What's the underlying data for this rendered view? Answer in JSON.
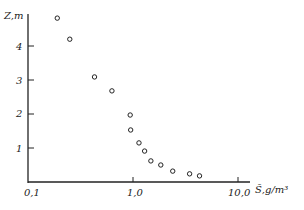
{
  "chart_data": {
    "type": "scatter",
    "title": "",
    "xlabel": "S̄, g/m³",
    "ylabel": "Z, m",
    "xscale": "log",
    "xlim": [
      0.1,
      12
    ],
    "ylim": [
      0,
      5
    ],
    "xticks": [
      "0,1",
      "1,0",
      "10,0"
    ],
    "yticks": [
      "1",
      "2",
      "3",
      "4"
    ],
    "grid": false,
    "legend": null,
    "x": [
      0.19,
      0.25,
      0.43,
      0.63,
      0.94,
      0.95,
      1.14,
      1.29,
      1.48,
      1.84,
      2.39,
      3.46,
      4.3
    ],
    "y": [
      4.82,
      4.2,
      3.09,
      2.68,
      1.97,
      1.53,
      1.15,
      0.91,
      0.62,
      0.5,
      0.32,
      0.24,
      0.18
    ]
  },
  "axes": {
    "y_label": "Z,m",
    "x_label": "S̄,g/m³",
    "x_tick_labels": [
      "0,1",
      "1,0",
      "10,0"
    ],
    "y_tick_labels": [
      "1",
      "2",
      "3",
      "4"
    ]
  }
}
